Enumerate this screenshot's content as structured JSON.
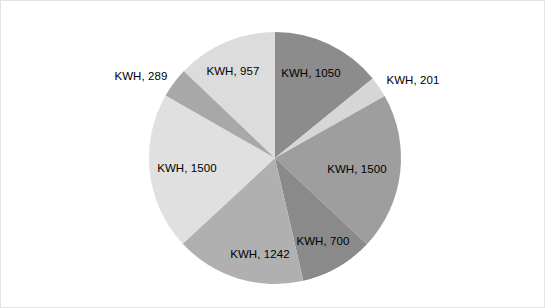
{
  "chart_data": {
    "type": "pie",
    "title": "",
    "subtitle": "",
    "xlabel": "",
    "ylabel": "",
    "grid": false,
    "legend_position": "none",
    "label_format": "KWH, {value}",
    "start_angle_deg": 0,
    "direction": "clockwise",
    "total": 7439,
    "categories": [
      "KWH",
      "KWH",
      "KWH",
      "KWH",
      "KWH",
      "KWH",
      "KWH",
      "KWH"
    ],
    "values": [
      1050,
      201,
      1500,
      700,
      1242,
      1500,
      289,
      957
    ],
    "labels": [
      "KWH, 1050",
      "KWH, 201",
      "KWH, 1500",
      "KWH, 700",
      "KWH, 1242",
      "KWH, 1500",
      "KWH, 289",
      "KWH, 957"
    ],
    "slices": [
      {
        "label": "KWH, 1050",
        "value": 1050,
        "color": "#8c8c8c",
        "label_pos": "inside",
        "label_x": 310,
        "label_y": 72
      },
      {
        "label": "KWH, 201",
        "value": 201,
        "color": "#d6d6d6",
        "label_pos": "outside",
        "label_x": 412,
        "label_y": 79
      },
      {
        "label": "KWH, 1500",
        "value": 1500,
        "color": "#9e9e9e",
        "label_pos": "inside",
        "label_x": 356,
        "label_y": 168
      },
      {
        "label": "KWH, 700",
        "value": 700,
        "color": "#8a8a8a",
        "label_pos": "inside",
        "label_x": 322,
        "label_y": 240
      },
      {
        "label": "KWH, 1242",
        "value": 1242,
        "color": "#b0b0b0",
        "label_pos": "inside",
        "label_x": 259,
        "label_y": 253
      },
      {
        "label": "KWH, 1500",
        "value": 1500,
        "color": "#e0e0e0",
        "label_pos": "inside",
        "label_x": 186,
        "label_y": 167
      },
      {
        "label": "KWH, 289",
        "value": 289,
        "color": "#a8a8a8",
        "label_pos": "outside",
        "label_x": 140,
        "label_y": 75
      },
      {
        "label": "KWH, 957",
        "value": 957,
        "color": "#dcdcdc",
        "label_pos": "inside",
        "label_x": 232,
        "label_y": 70
      }
    ],
    "geometry": {
      "center_x": 274,
      "center_y": 157,
      "radius": 126
    },
    "colors": {
      "background": "#ffffff",
      "border": "#e3e3e3",
      "text": "#000000"
    }
  }
}
